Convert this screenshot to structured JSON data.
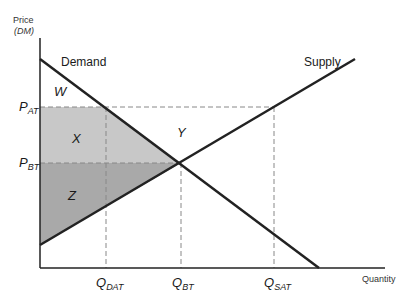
{
  "axes": {
    "y_title_line1": "Price",
    "y_title_line2": "(DM)",
    "x_title": "Quantity"
  },
  "curves": {
    "demand_label": "Demand",
    "supply_label": "Supply"
  },
  "areas": {
    "w": "W",
    "x": "X",
    "y": "Y",
    "z": "Z"
  },
  "y_ticks": [
    {
      "main": "P",
      "sub": "AT"
    },
    {
      "main": "P",
      "sub": "BT"
    }
  ],
  "x_ticks": [
    {
      "main": "Q",
      "sub": "DAT"
    },
    {
      "main": "Q",
      "sub": "BT"
    },
    {
      "main": "Q",
      "sub": "SAT"
    }
  ],
  "colors": {
    "line": "#222222",
    "dash": "#888888",
    "shade_upper": "#c8c8c8",
    "shade_lower": "#a9a9a9"
  }
}
